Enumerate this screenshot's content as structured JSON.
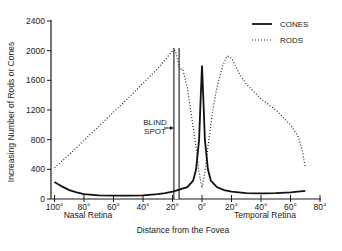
{
  "chart_data": {
    "type": "line",
    "title": "",
    "xlabel": "Distance from the Fovea",
    "ylabel": "Increasing Number of Rods or Cones",
    "region_labels": {
      "left": "Nasal Retina",
      "right": "Temporal Retina"
    },
    "x_ticks": [
      "100°",
      "80°",
      "60°",
      "40°",
      "20°",
      "0°",
      "20°",
      "40°",
      "60°",
      "80°"
    ],
    "x_tick_values": [
      -100,
      -80,
      -60,
      -40,
      -20,
      0,
      20,
      40,
      60,
      80
    ],
    "y_ticks": [
      0,
      400,
      800,
      1200,
      1600,
      2000,
      2400
    ],
    "xlim": [
      -100,
      80
    ],
    "ylim": [
      0,
      2400
    ],
    "grid": false,
    "legend_position": "upper right",
    "annotations": [
      {
        "text_line1": "BLIND",
        "text_line2": "SPOT",
        "x_range": [
          -18,
          -15
        ]
      }
    ],
    "series": [
      {
        "name": "CONES",
        "style": "solid",
        "x": [
          -100,
          -95,
          -90,
          -85,
          -80,
          -70,
          -60,
          -50,
          -40,
          -30,
          -25,
          -20,
          -18,
          -15,
          -10,
          -6,
          -4,
          -2,
          -1,
          0,
          1,
          2,
          4,
          6,
          10,
          15,
          20,
          30,
          40,
          50,
          60,
          70
        ],
        "y": [
          230,
          170,
          120,
          90,
          65,
          50,
          45,
          45,
          50,
          65,
          80,
          100,
          110,
          130,
          160,
          250,
          400,
          800,
          1300,
          1800,
          1300,
          800,
          400,
          250,
          160,
          120,
          100,
          80,
          75,
          80,
          90,
          110
        ]
      },
      {
        "name": "RODS",
        "style": "dotted",
        "x": [
          -100,
          -90,
          -80,
          -70,
          -60,
          -50,
          -40,
          -30,
          -24,
          -20,
          -18,
          -15,
          -13,
          -10,
          -7,
          -4,
          -2,
          0,
          2,
          4,
          7,
          10,
          14,
          17,
          20,
          25,
          30,
          40,
          50,
          60,
          65,
          68,
          70
        ],
        "y": [
          420,
          600,
          790,
          980,
          1170,
          1360,
          1560,
          1760,
          1900,
          2000,
          2000,
          1750,
          1750,
          1500,
          1100,
          700,
          350,
          150,
          350,
          700,
          1150,
          1500,
          1800,
          1930,
          1900,
          1700,
          1550,
          1350,
          1200,
          1000,
          850,
          650,
          420
        ]
      }
    ]
  },
  "legend": [
    {
      "label": "CONES",
      "style": "solid"
    },
    {
      "label": "RODS",
      "style": "dotted"
    }
  ]
}
